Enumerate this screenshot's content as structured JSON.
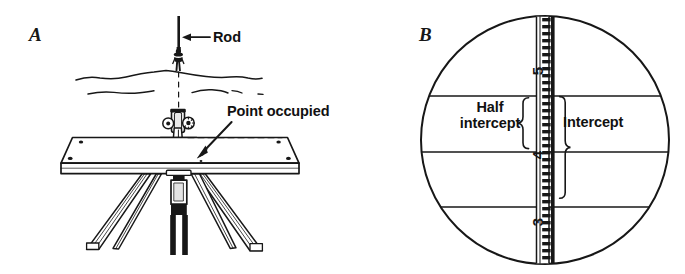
{
  "figure": {
    "background_color": "#ffffff",
    "ink_color": "#171717",
    "width": 685,
    "height": 274
  },
  "panels": [
    {
      "key": "a",
      "letter": "A",
      "description": "Perspective drawing of a plane table on a tripod with an alidade, sighting a leveling rod held by a person standing on uneven ground in the distance.",
      "labels": [
        {
          "key": "rod",
          "text": "Rod",
          "pointer": "arrow-left",
          "target": "rod-held-by-rodman"
        },
        {
          "key": "point_occupied",
          "text": "Point occupied",
          "pointer": "arrow-down-left",
          "target": "plumb-point-on-table"
        }
      ],
      "elements": [
        "leveling-rod",
        "rodman-figure",
        "ground-horizon-line",
        "secondary-ground-line",
        "vertical-dashed-plumb-line",
        "alidade",
        "plane-table-board",
        "tripod-legs",
        "plumb-bob"
      ]
    },
    {
      "key": "b",
      "letter": "B",
      "description": "Circular telescope field of view showing three horizontal stadia cross hairs intersecting a graduated stadia rod, with braces marking the half intercept and the full intercept.",
      "labels": [
        {
          "key": "half_intercept",
          "text": "Half\nintercept",
          "line1": "Half",
          "line2": "intercept",
          "brace": "right-brace-small"
        },
        {
          "key": "intercept",
          "text": "Intercept",
          "brace": "right-brace-large"
        }
      ],
      "elements": [
        "telescope-field-circle",
        "upper-stadia-hair",
        "middle-cross-hair",
        "lower-stadia-hair",
        "vertical-cross-hair",
        "stadia-rod",
        "rod-graduations",
        "rod-numerals"
      ],
      "cross_hairs": 3,
      "rod_numerals": [
        "5",
        "4",
        "3"
      ]
    }
  ]
}
